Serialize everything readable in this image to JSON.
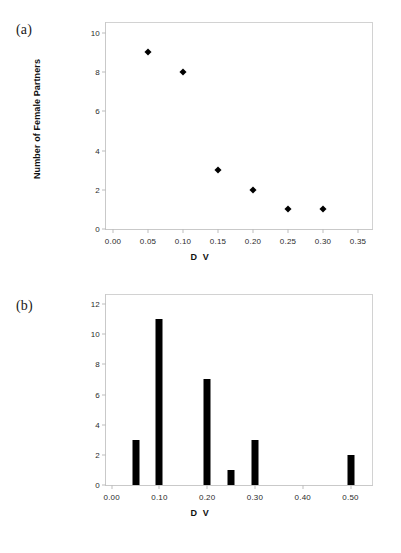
{
  "figure": {
    "panels": [
      {
        "id": "a",
        "label": "(a)"
      },
      {
        "id": "b",
        "label": "(b)"
      }
    ]
  },
  "chart_data": [
    {
      "type": "scatter",
      "panel": "(a)",
      "title": "",
      "xlabel": "D V",
      "ylabel": "Number of Female Partners",
      "xlim": [
        -0.01,
        0.37
      ],
      "ylim": [
        0,
        10.5
      ],
      "grid": false,
      "legend": "none",
      "xticks": [
        "0.00",
        "0.05",
        "0.10",
        "0.15",
        "0.20",
        "0.25",
        "0.30",
        "0.35"
      ],
      "xtickvals": [
        0.0,
        0.05,
        0.1,
        0.15,
        0.2,
        0.25,
        0.3,
        0.35
      ],
      "yticks": [
        "0",
        "2",
        "4",
        "6",
        "8",
        "10"
      ],
      "ytickvals": [
        0,
        2,
        4,
        6,
        8,
        10
      ],
      "x": [
        0.05,
        0.1,
        0.15,
        0.2,
        0.25,
        0.3
      ],
      "y": [
        9,
        8,
        3,
        2,
        1,
        1
      ],
      "marker": "diamond",
      "marker_color": "#000000"
    },
    {
      "type": "bar",
      "panel": "(b)",
      "title": "",
      "xlabel": "D V",
      "ylabel": "",
      "xlim": [
        -0.012,
        0.545
      ],
      "ylim": [
        0,
        12.6
      ],
      "grid": false,
      "legend": "none",
      "xticks": [
        "0.00",
        "0.10",
        "0.20",
        "0.30",
        "0.40",
        "0.50"
      ],
      "xtickvals": [
        0.0,
        0.1,
        0.2,
        0.3,
        0.4,
        0.5
      ],
      "yticks": [
        "0",
        "2",
        "4",
        "6",
        "8",
        "10",
        "12"
      ],
      "ytickvals": [
        0,
        2,
        4,
        6,
        8,
        10,
        12
      ],
      "categories": [
        0.05,
        0.1,
        0.2,
        0.25,
        0.3,
        0.5
      ],
      "values": [
        3,
        11,
        7,
        1,
        3,
        2
      ],
      "bar_color": "#000000"
    }
  ]
}
